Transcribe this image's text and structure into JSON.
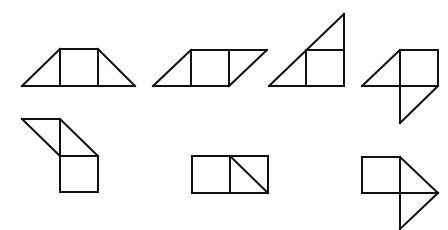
{
  "diagram": {
    "background": "#ffffff",
    "stroke_color": "#111111",
    "stroke_width": 2,
    "figures": [
      {
        "id": "figure-1",
        "description": "trapezoid: left triangle + square + right triangle",
        "segments": [
          [
            22,
            86,
            135,
            86
          ],
          [
            60,
            49,
            98,
            49
          ],
          [
            22,
            86,
            60,
            49
          ],
          [
            98,
            49,
            135,
            86
          ],
          [
            60,
            49,
            60,
            86
          ],
          [
            98,
            49,
            98,
            86
          ]
        ]
      },
      {
        "id": "figure-2",
        "description": "parallelogram: left triangle + square + right triangle",
        "segments": [
          [
            153,
            86,
            229,
            86
          ],
          [
            191,
            50,
            267,
            50
          ],
          [
            153,
            86,
            191,
            50
          ],
          [
            229,
            86,
            267,
            50
          ],
          [
            191,
            50,
            191,
            86
          ],
          [
            229,
            50,
            229,
            86
          ]
        ]
      },
      {
        "id": "figure-3",
        "description": "large right triangle with square at bottom-right",
        "segments": [
          [
            269,
            86,
            344,
            86
          ],
          [
            344,
            14,
            344,
            86
          ],
          [
            269,
            86,
            344,
            14
          ],
          [
            306,
            50,
            306,
            86
          ],
          [
            306,
            50,
            344,
            50
          ]
        ]
      },
      {
        "id": "figure-4",
        "description": "square with triangle on left and triangle below",
        "segments": [
          [
            400,
            50,
            438,
            50
          ],
          [
            438,
            50,
            438,
            86
          ],
          [
            362,
            86,
            438,
            86
          ],
          [
            362,
            86,
            400,
            50
          ],
          [
            400,
            50,
            400,
            123
          ],
          [
            438,
            86,
            400,
            123
          ]
        ]
      },
      {
        "id": "figure-5",
        "description": "two triangles above a square",
        "segments": [
          [
            22,
            119,
            60,
            119
          ],
          [
            22,
            119,
            60,
            156
          ],
          [
            60,
            119,
            60,
            192
          ],
          [
            60,
            119,
            98,
            156
          ],
          [
            60,
            156,
            98,
            156
          ],
          [
            98,
            156,
            98,
            192
          ],
          [
            60,
            192,
            98,
            192
          ]
        ]
      },
      {
        "id": "figure-6",
        "description": "square beside a diagonally split square",
        "segments": [
          [
            192,
            156,
            268,
            156
          ],
          [
            192,
            193,
            268,
            193
          ],
          [
            192,
            156,
            192,
            193
          ],
          [
            268,
            156,
            268,
            193
          ],
          [
            230,
            156,
            230,
            193
          ],
          [
            230,
            156,
            268,
            193
          ]
        ]
      },
      {
        "id": "figure-7",
        "description": "square with two triangles on the right",
        "segments": [
          [
            362,
            157,
            400,
            157
          ],
          [
            362,
            157,
            362,
            193
          ],
          [
            362,
            193,
            438,
            193
          ],
          [
            400,
            157,
            400,
            229
          ],
          [
            400,
            157,
            438,
            193
          ],
          [
            438,
            193,
            400,
            229
          ]
        ]
      }
    ]
  }
}
